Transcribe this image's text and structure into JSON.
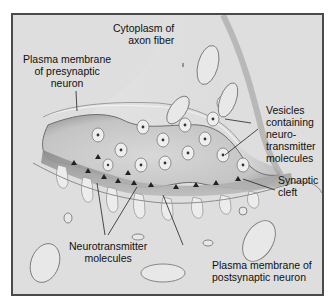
{
  "figure": {
    "labels": {
      "cytoplasm": [
        "Cytoplasm of",
        "axon fiber"
      ],
      "presynaptic_membrane": [
        "Plasma membrane",
        "of presynaptic",
        "neuron"
      ],
      "vesicles": [
        "Vesicles",
        "containing",
        "neuro-",
        "transmitter",
        "molecules"
      ],
      "synaptic_cleft": [
        "Synaptic",
        "cleft"
      ],
      "neurotransmitter": [
        "Neurotransmitter",
        "molecules"
      ],
      "postsynaptic_membrane": [
        "Plasma membrane of",
        "postsynaptic neuron"
      ]
    },
    "colors": {
      "background": "#dcdcdc",
      "frame": "#4a4a4a",
      "axon_terminal": "#cfcfcf",
      "terminal_shadow": "#9a9a9a",
      "cleft": "#a8a8a8",
      "postsynaptic": "#e2e2e2",
      "leader_line": "#222222"
    }
  }
}
